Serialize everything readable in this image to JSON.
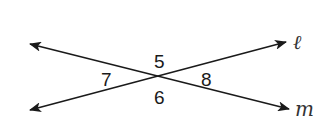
{
  "diagram": {
    "type": "intersecting-lines",
    "lines": [
      {
        "name": "l",
        "label": "ℓ",
        "from": [
          26,
          111
        ],
        "to": [
          290,
          41
        ]
      },
      {
        "name": "m",
        "label": "m",
        "from": [
          26,
          43
        ],
        "to": [
          293,
          110
        ]
      }
    ],
    "intersection": [
      160,
      77
    ],
    "angles": [
      {
        "label": "5",
        "position": "top"
      },
      {
        "label": "6",
        "position": "bottom"
      },
      {
        "label": "7",
        "position": "left"
      },
      {
        "label": "8",
        "position": "right"
      }
    ],
    "colors": {
      "line": "#1a1a1a",
      "background": "#ffffff"
    }
  }
}
